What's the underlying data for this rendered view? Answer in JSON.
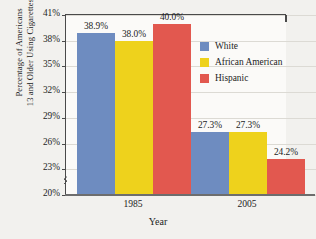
{
  "chart_data": {
    "type": "bar",
    "title": "",
    "xlabel": "Year",
    "ylabel_line1": "Percentage of Americans",
    "ylabel_line2": "13 and Older Using Cigarettes",
    "categories": [
      "1985",
      "2005"
    ],
    "series": [
      {
        "name": "White",
        "color": "#6e8cc0",
        "values": [
          38.9,
          27.3
        ],
        "labels": [
          "38.9%",
          "27.3%"
        ]
      },
      {
        "name": "African American",
        "color": "#eed21c",
        "values": [
          38.0,
          27.3
        ],
        "labels": [
          "38.0%",
          "27.3%"
        ]
      },
      {
        "name": "Hispanic",
        "color": "#e2584f",
        "values": [
          40.0,
          24.2
        ],
        "labels": [
          "40.0%",
          "24.2%"
        ]
      }
    ],
    "ylim": [
      20,
      41
    ],
    "yticks": [
      41,
      38,
      35,
      32,
      29,
      26,
      23,
      20
    ],
    "ytick_labels": [
      "41%",
      "38%",
      "35%",
      "32%",
      "29%",
      "26%",
      "23%",
      "20%"
    ],
    "grid": true,
    "axis_break": true,
    "legend_position": "right-top",
    "legend_entries": [
      "White",
      "African American",
      "Hispanic"
    ]
  }
}
